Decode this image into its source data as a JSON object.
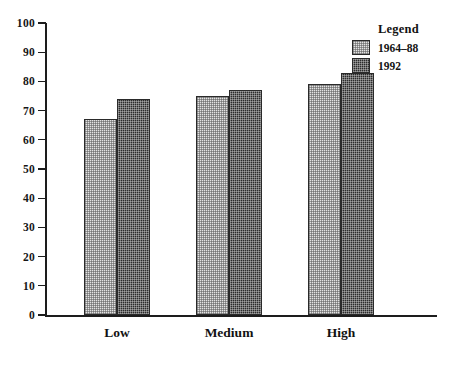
{
  "chart_data": {
    "type": "bar",
    "title": "",
    "xlabel": "",
    "ylabel": "",
    "categories": [
      "Low",
      "Medium",
      "High"
    ],
    "series": [
      {
        "name": "1964–88",
        "values": [
          67,
          75,
          79
        ],
        "swatch": "light",
        "color": "#e3e3e3"
      },
      {
        "name": "1992",
        "values": [
          74,
          77,
          83
        ],
        "swatch": "dark",
        "color": "#2b2b2b"
      }
    ],
    "ylim": [
      0,
      100
    ],
    "yticks": [
      0,
      10,
      20,
      30,
      40,
      50,
      60,
      70,
      80,
      90,
      100
    ],
    "ytick_labels": [
      "0",
      "10",
      "20",
      "30",
      "40",
      "50",
      "60",
      "70",
      "80",
      "90",
      "100"
    ],
    "grid": false,
    "legend": {
      "title": "Legend",
      "position": "top-right",
      "entries": [
        {
          "label": "1964–88",
          "swatch": "light"
        },
        {
          "label": "1992",
          "swatch": "dark"
        }
      ]
    }
  }
}
